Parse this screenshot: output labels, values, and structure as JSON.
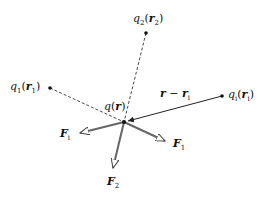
{
  "diagram": {
    "center": {
      "label": "q(r)",
      "q": "q",
      "r": "r"
    },
    "charges": [
      {
        "name": "q2",
        "q": "q",
        "q_sub": "2",
        "r": "r",
        "r_sub": "2"
      },
      {
        "name": "q1",
        "q": "q",
        "q_sub": "1",
        "r": "r",
        "r_sub": "1"
      },
      {
        "name": "qi",
        "q": "q",
        "q_sub": "i",
        "r": "r",
        "r_sub": "i"
      }
    ],
    "vector_label": {
      "a": "r",
      "op": " − ",
      "b": "r",
      "b_sub": "i"
    },
    "forces": [
      {
        "name": "Fi",
        "F": "F",
        "sub": "i"
      },
      {
        "name": "F1",
        "F": "F",
        "sub": "1"
      },
      {
        "name": "F2",
        "F": "F",
        "sub": "2"
      }
    ],
    "colors": {
      "line": "#222222",
      "arrow": "#555555",
      "background": "#ffffff"
    }
  }
}
